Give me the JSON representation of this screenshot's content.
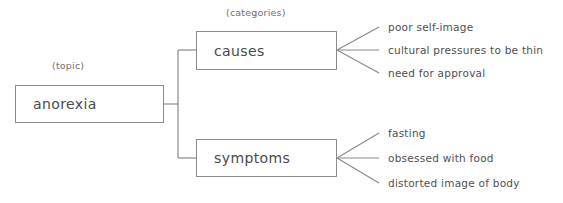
{
  "diagram": {
    "title_topic_tag": "(topic)",
    "title_categories_tag": "(categories)",
    "topic": {
      "label": "anorexia"
    },
    "branches": [
      {
        "label": "causes",
        "items": [
          "poor self-image",
          "cultural pressures to be thin",
          "need for approval"
        ]
      },
      {
        "label": "symptoms",
        "items": [
          "fasting",
          "obsessed with food",
          "distorted image of body"
        ]
      }
    ],
    "colors": {
      "box_border": "#8c8c8c",
      "connector": "#8a8a8a",
      "text": "#4a4a4a",
      "tag_text": "#6f6f6f",
      "background": "#ffffff"
    }
  }
}
